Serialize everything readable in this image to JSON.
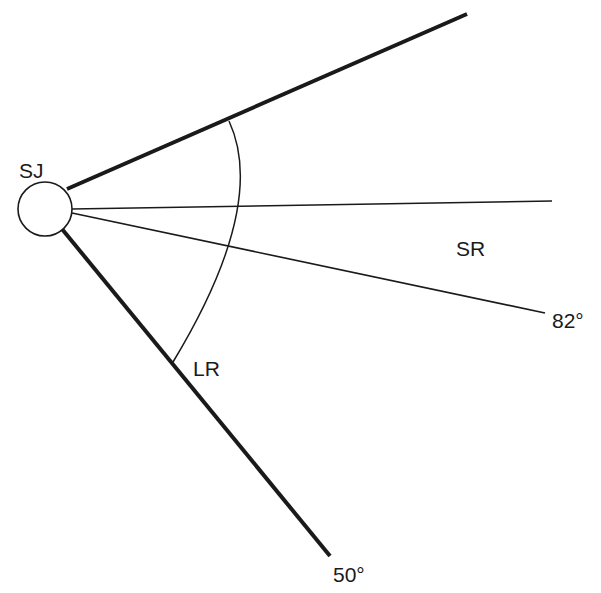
{
  "diagram": {
    "type": "angular-diagram",
    "colors": {
      "background": "#ffffff",
      "stroke": "#1a1a1a"
    },
    "origin": {
      "label": "SJ",
      "center": [
        45,
        209
      ],
      "radius": 27
    },
    "labels": {
      "origin": "SJ",
      "upper_region": "SR",
      "lower_region": "LR",
      "angle_82": "82°",
      "angle_50": "50°"
    },
    "lines": [
      {
        "id": "upper-boundary",
        "from": [
          67,
          189
        ],
        "to": [
          467,
          14
        ],
        "weight": "thick"
      },
      {
        "id": "horizontal-reference",
        "from": [
          72,
          209
        ],
        "to": [
          552,
          201
        ],
        "weight": "thin"
      },
      {
        "id": "ray-82",
        "from": [
          72,
          213
        ],
        "to": [
          545,
          313
        ],
        "weight": "thin",
        "label": "82°"
      },
      {
        "id": "ray-50",
        "from": [
          62,
          229
        ],
        "to": [
          330,
          556
        ],
        "weight": "thick",
        "label": "50°"
      }
    ],
    "arc": {
      "from": [
        229,
        121
      ],
      "through": [
        250,
        208
      ],
      "to": [
        173,
        362
      ]
    }
  }
}
